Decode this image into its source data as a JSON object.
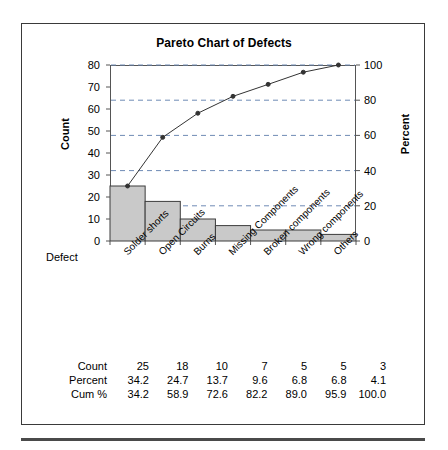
{
  "figure": {
    "title": "Pareto Chart of Defects"
  },
  "chart_data": {
    "type": "bar",
    "title": "Pareto Chart of Defects",
    "xlabel": "Defect",
    "ylabel": "Count",
    "y2label": "Percent",
    "categories": [
      "Solder shorts",
      "Open Circuits",
      "Burns",
      "Missing Components",
      "Broken components",
      "Wrong components",
      "Others"
    ],
    "values": [
      25,
      18,
      10,
      7,
      5,
      5,
      3
    ],
    "percent": [
      34.2,
      24.7,
      13.7,
      9.6,
      6.8,
      6.8,
      4.1
    ],
    "cumulative_percent": [
      34.2,
      58.9,
      72.6,
      82.2,
      89.0,
      95.9,
      100.0
    ],
    "ylim": [
      0,
      80
    ],
    "yticks": [
      0,
      10,
      20,
      30,
      40,
      50,
      60,
      70,
      80
    ],
    "y2lim": [
      0,
      100
    ],
    "y2ticks": [
      0,
      20,
      40,
      60,
      80,
      100
    ],
    "grid": true,
    "grid_style": "dashed",
    "grid_axis": "percent",
    "legend": "none",
    "total_count": 73,
    "bar_color": "#c9c9c9",
    "bar_edge_color": "#3c3c3c",
    "line_color": "#333333",
    "marker": "filled-circle",
    "axis_color": "#555555",
    "grid_color": "#6f8bb5"
  },
  "table": {
    "rows": [
      {
        "label": "Count",
        "values": [
          "25",
          "18",
          "10",
          "7",
          "5",
          "5",
          "3"
        ]
      },
      {
        "label": "Percent",
        "values": [
          "34.2",
          "24.7",
          "13.7",
          "9.6",
          "6.8",
          "6.8",
          "4.1"
        ]
      },
      {
        "label": "Cum %",
        "values": [
          "34.2",
          "58.9",
          "72.6",
          "82.2",
          "89.0",
          "95.9",
          "100.0"
        ]
      }
    ]
  }
}
